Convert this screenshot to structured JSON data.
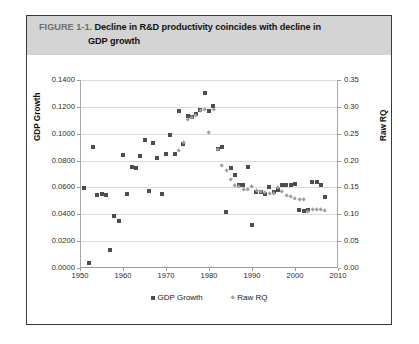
{
  "figure": {
    "number": "FIGURE 1-1.",
    "title_line1": "Decline in R&D productivity coincides with decline in",
    "title_line2": "GDP growth",
    "header_bg": "#d4d4d4",
    "border_color": "#3a3a3a"
  },
  "legend": {
    "position": "bottom-center",
    "items": [
      {
        "label": "GDP Growth",
        "marker": "square",
        "color": "#4d4d4d"
      },
      {
        "label": "Raw RQ",
        "marker": "diamond",
        "color": "#9e9e9e"
      }
    ]
  },
  "chart_data": {
    "type": "scatter",
    "title": "Decline in R&D productivity coincides with decline in GDP growth",
    "xlabel": "",
    "ylabel": "GDP Growth",
    "y2label": "Raw RQ",
    "grid": true,
    "xlim": [
      1950,
      2010
    ],
    "ylim": [
      0.0,
      0.14
    ],
    "y2lim": [
      0.0,
      0.35
    ],
    "xticks": [
      "1950",
      "1960",
      "1970",
      "1980",
      "1990",
      "2000",
      "2010"
    ],
    "xtick_values": [
      1950,
      1960,
      1970,
      1980,
      1990,
      2000,
      2010
    ],
    "yticks": [
      "0.0000",
      "0.0200",
      "0.0400",
      "0.0600",
      "0.0800",
      "0.1000",
      "0.1200",
      "0.1400"
    ],
    "ytick_values": [
      0.0,
      0.02,
      0.04,
      0.06,
      0.08,
      0.1,
      0.12,
      0.14
    ],
    "y2ticks": [
      "0.00",
      "0.05",
      "0.10",
      "0.15",
      "0.20",
      "0.25",
      "0.30",
      "0.35"
    ],
    "y2tick_values": [
      0.0,
      0.05,
      0.1,
      0.15,
      0.2,
      0.25,
      0.3,
      0.35
    ],
    "series": [
      {
        "name": "GDP Growth",
        "marker": "square",
        "color": "#4d4d4d",
        "axis": "left",
        "points": [
          [
            1951,
            0.0593
          ],
          [
            1952,
            0.004
          ],
          [
            1953,
            0.0898
          ],
          [
            1954,
            0.0545
          ],
          [
            1955,
            0.0548
          ],
          [
            1956,
            0.0545
          ],
          [
            1957,
            0.0135
          ],
          [
            1958,
            0.039
          ],
          [
            1959,
            0.0352
          ],
          [
            1960,
            0.084
          ],
          [
            1961,
            0.0548
          ],
          [
            1962,
            0.0752
          ],
          [
            1963,
            0.0742
          ],
          [
            1964,
            0.0836
          ],
          [
            1965,
            0.0955
          ],
          [
            1966,
            0.057
          ],
          [
            1967,
            0.093
          ],
          [
            1968,
            0.0817
          ],
          [
            1969,
            0.0548
          ],
          [
            1970,
            0.0851
          ],
          [
            1971,
            0.0988
          ],
          [
            1972,
            0.0846
          ],
          [
            1973,
            0.117
          ],
          [
            1974,
            0.0925
          ],
          [
            1975,
            0.1135
          ],
          [
            1976,
            0.1128
          ],
          [
            1977,
            0.1145
          ],
          [
            1978,
            0.118
          ],
          [
            1979,
            0.1302
          ],
          [
            1980,
            0.117
          ],
          [
            1981,
            0.121
          ],
          [
            1982,
            0.0885
          ],
          [
            1983,
            0.09
          ],
          [
            1984,
            0.0415
          ],
          [
            1985,
            0.0745
          ],
          [
            1986,
            0.069
          ],
          [
            1987,
            0.062
          ],
          [
            1988,
            0.062
          ],
          [
            1989,
            0.075
          ],
          [
            1990,
            0.0323
          ],
          [
            1991,
            0.0565
          ],
          [
            1992,
            0.0566
          ],
          [
            1993,
            0.055
          ],
          [
            1994,
            0.0604
          ],
          [
            1995,
            0.0568
          ],
          [
            1996,
            0.058
          ],
          [
            1997,
            0.062
          ],
          [
            1998,
            0.0618
          ],
          [
            1999,
            0.062
          ],
          [
            2000,
            0.0622
          ],
          [
            2001,
            0.0435
          ],
          [
            2002,
            0.0425
          ],
          [
            2003,
            0.043
          ],
          [
            2004,
            0.064
          ],
          [
            2005,
            0.0643
          ],
          [
            2006,
            0.062
          ],
          [
            2007,
            0.053
          ]
        ]
      },
      {
        "name": "Raw RQ",
        "marker": "diamond",
        "color": "#9e9e9e",
        "axis": "right",
        "points": [
          [
            1973,
            0.218
          ],
          [
            1974,
            0.2325
          ],
          [
            1975,
            0.277
          ],
          [
            1976,
            0.279
          ],
          [
            1977,
            0.284
          ],
          [
            1978,
            0.293
          ],
          [
            1979,
            0.295
          ],
          [
            1980,
            0.252
          ],
          [
            1981,
            0.294
          ],
          [
            1982,
            0.22
          ],
          [
            1983,
            0.19
          ],
          [
            1984,
            0.182
          ],
          [
            1985,
            0.164
          ],
          [
            1986,
            0.153
          ],
          [
            1987,
            0.152
          ],
          [
            1988,
            0.1465
          ],
          [
            1989,
            0.145
          ],
          [
            1990,
            0.152
          ],
          [
            1991,
            0.144
          ],
          [
            1992,
            0.142
          ],
          [
            1993,
            0.14
          ],
          [
            1994,
            0.139
          ],
          [
            1995,
            0.138
          ],
          [
            1996,
            0.15
          ],
          [
            1997,
            0.143
          ],
          [
            1998,
            0.134
          ],
          [
            1999,
            0.132
          ],
          [
            2000,
            0.1285
          ],
          [
            2001,
            0.128
          ],
          [
            2002,
            0.127
          ],
          [
            2003,
            0.105
          ],
          [
            2004,
            0.108
          ],
          [
            2005,
            0.109
          ],
          [
            2006,
            0.1085
          ],
          [
            2007,
            0.106
          ]
        ]
      }
    ]
  }
}
